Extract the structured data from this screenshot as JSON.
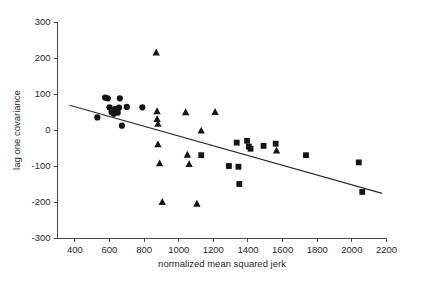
{
  "chart_data": {
    "type": "scatter",
    "title": "",
    "xlabel": "normalized mean squared jerk",
    "ylabel": "lag one covariance",
    "xlim": [
      300,
      2200
    ],
    "ylim": [
      -300,
      300
    ],
    "xticks": [
      400,
      600,
      800,
      1000,
      1200,
      1400,
      1600,
      1800,
      2000,
      2200
    ],
    "yticks": [
      -300,
      -200,
      -100,
      0,
      100,
      200,
      300
    ],
    "grid": false,
    "legend": "none",
    "series": [
      {
        "name": "circles",
        "marker": "circle",
        "points": [
          [
            530,
            35
          ],
          [
            575,
            90
          ],
          [
            590,
            88
          ],
          [
            600,
            63
          ],
          [
            612,
            50
          ],
          [
            620,
            55
          ],
          [
            625,
            45
          ],
          [
            630,
            58
          ],
          [
            640,
            52
          ],
          [
            648,
            48
          ],
          [
            655,
            62
          ],
          [
            660,
            88
          ],
          [
            672,
            12
          ],
          [
            700,
            64
          ],
          [
            790,
            63
          ]
        ]
      },
      {
        "name": "triangles",
        "marker": "triangle",
        "points": [
          [
            870,
            215
          ],
          [
            875,
            52
          ],
          [
            875,
            30
          ],
          [
            880,
            17
          ],
          [
            880,
            -40
          ],
          [
            890,
            -93
          ],
          [
            905,
            -200
          ],
          [
            1040,
            49
          ],
          [
            1050,
            -69
          ],
          [
            1060,
            -95
          ],
          [
            1105,
            -205
          ],
          [
            1130,
            -2
          ],
          [
            1210,
            50
          ],
          [
            1565,
            -57
          ]
        ]
      },
      {
        "name": "squares",
        "marker": "square",
        "points": [
          [
            1130,
            -70
          ],
          [
            1290,
            -100
          ],
          [
            1335,
            -35
          ],
          [
            1345,
            -102
          ],
          [
            1350,
            -150
          ],
          [
            1395,
            -30
          ],
          [
            1405,
            -46
          ],
          [
            1415,
            -52
          ],
          [
            1490,
            -44
          ],
          [
            1560,
            -38
          ],
          [
            1735,
            -70
          ],
          [
            2040,
            -90
          ],
          [
            2060,
            -172
          ]
        ]
      }
    ],
    "trend_line": {
      "name": "regression-line",
      "x_start": 370,
      "y_start": 69,
      "x_end": 2175,
      "y_end": -176
    }
  }
}
